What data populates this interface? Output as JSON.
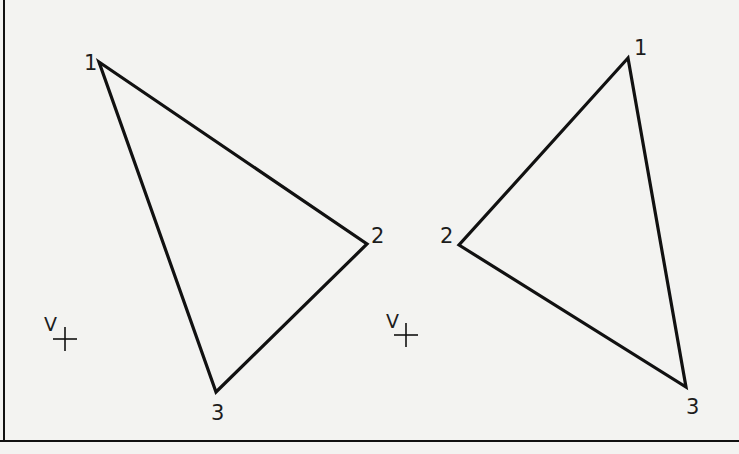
{
  "colors": {
    "background": "#f3f3f1",
    "ink": "#111111"
  },
  "frame": {
    "left_line_x": 4,
    "bottom_line_y": 441
  },
  "figures": [
    {
      "name": "left-triangle",
      "vertices": [
        {
          "label": "1",
          "x": 99,
          "y": 62,
          "label_x": 84,
          "label_y": 70
        },
        {
          "label": "2",
          "x": 367,
          "y": 244,
          "label_x": 371,
          "label_y": 243
        },
        {
          "label": "3",
          "x": 216,
          "y": 392,
          "label_x": 211,
          "label_y": 420
        }
      ],
      "viewpoint": {
        "label": "V",
        "label_x": 44,
        "label_y": 331,
        "cross_x": 65,
        "cross_y": 339
      }
    },
    {
      "name": "right-triangle",
      "vertices": [
        {
          "label": "1",
          "x": 628,
          "y": 58,
          "label_x": 634,
          "label_y": 55
        },
        {
          "label": "2",
          "x": 459,
          "y": 245,
          "label_x": 440,
          "label_y": 243
        },
        {
          "label": "3",
          "x": 686,
          "y": 387,
          "label_x": 686,
          "label_y": 414
        }
      ],
      "viewpoint": {
        "label": "V",
        "label_x": 386,
        "label_y": 328,
        "cross_x": 406,
        "cross_y": 335
      }
    }
  ]
}
